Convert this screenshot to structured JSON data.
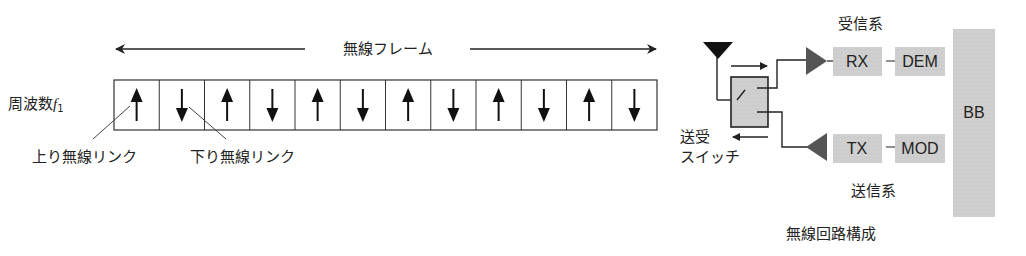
{
  "frame": {
    "title": "無線フレーム",
    "freq_label": "周波数",
    "freq_symbol": "f",
    "freq_sub": "1",
    "slots": [
      "up",
      "down",
      "up",
      "down",
      "up",
      "down",
      "up",
      "down",
      "up",
      "down",
      "up",
      "down"
    ],
    "uplink_label": "上り無線リンク",
    "downlink_label": "下り無線リンク"
  },
  "circuit": {
    "switch_label_line1": "送受",
    "switch_label_line2": "スイッチ",
    "rx_group_label": "受信系",
    "tx_group_label": "送信系",
    "rx_block": "RX",
    "dem_block": "DEM",
    "tx_block": "TX",
    "mod_block": "MOD",
    "bb_block": "BB",
    "caption": "無線回路構成"
  },
  "colors": {
    "line": "#222222",
    "block_fill": "#cfcfcf",
    "switch_fill": "#bdbdbd",
    "amp_fill": "#555555"
  }
}
